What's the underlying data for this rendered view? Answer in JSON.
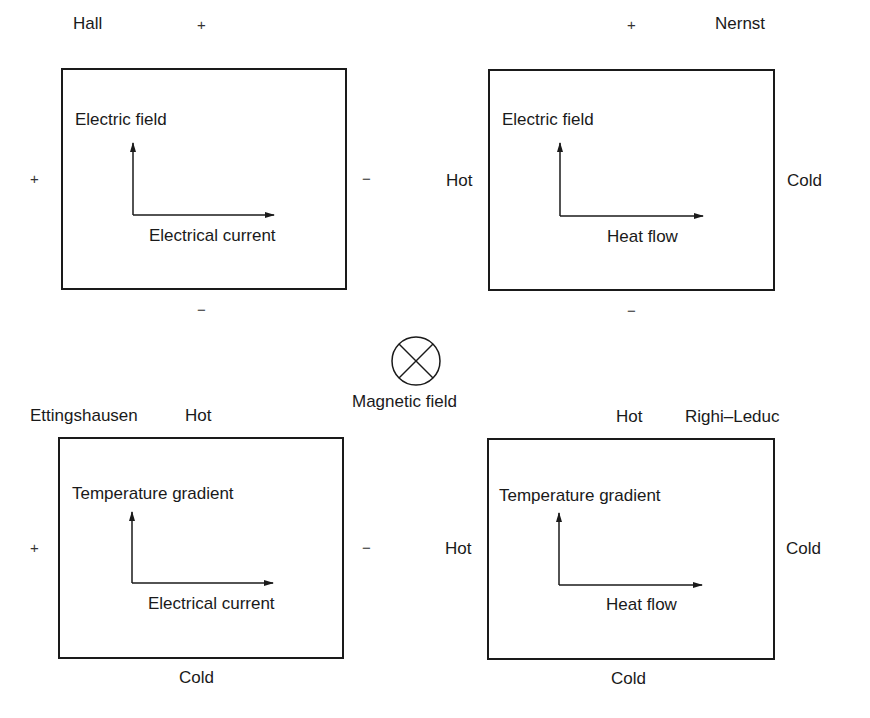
{
  "diagram": {
    "center": {
      "symbol": "into-page (⊗)",
      "label": "Magnetic field"
    },
    "panels": [
      {
        "name": "Hall",
        "title": "Hall",
        "top": "+",
        "bottom": "−",
        "left": "+",
        "right": "−",
        "vertical_axis": "Electric field",
        "horizontal_axis": "Electrical current"
      },
      {
        "name": "Nernst",
        "title": "Nernst",
        "top": "+",
        "bottom": "−",
        "left": "Hot",
        "right": "Cold",
        "vertical_axis": "Electric field",
        "horizontal_axis": "Heat flow"
      },
      {
        "name": "Ettingshausen",
        "title": "Ettingshausen",
        "top": "Hot",
        "bottom": "Cold",
        "left": "+",
        "right": "−",
        "vertical_axis": "Temperature gradient",
        "horizontal_axis": "Electrical current"
      },
      {
        "name": "Righi-Leduc",
        "title": "Righi–Leduc",
        "top": "Hot",
        "bottom": "Cold",
        "left": "Hot",
        "right": "Cold",
        "vertical_axis": "Temperature gradient",
        "horizontal_axis": "Heat flow"
      }
    ]
  }
}
